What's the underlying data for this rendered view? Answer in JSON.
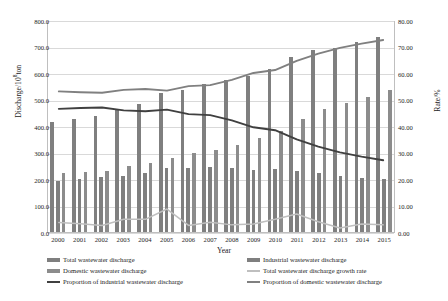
{
  "chart_data": {
    "type": "bar",
    "title": "",
    "xlabel": "Year",
    "ylabel_left": "Discharge/10⁸ton",
    "ylabel_right": "Rate/%",
    "categories": [
      "2000",
      "2001",
      "2002",
      "2003",
      "2004",
      "2005",
      "2006",
      "2007",
      "2008",
      "2009",
      "2010",
      "2011",
      "2012",
      "2013",
      "2014",
      "2015"
    ],
    "ylim_left": [
      0,
      800
    ],
    "ylim_right": [
      0,
      80
    ],
    "yticks_left": [
      "0.0",
      "100.0",
      "200.0",
      "300.0",
      "400.0",
      "500.0",
      "600.0",
      "700.0",
      "800.0"
    ],
    "yticks_right": [
      "0.00",
      "10.00",
      "20.00",
      "30.00",
      "40.00",
      "50.00",
      "60.00",
      "70.00",
      "80.00"
    ],
    "grid": true,
    "legend_position": "bottom",
    "series": [
      {
        "name": "Total wastewater discharge",
        "type": "bar",
        "axis": "left",
        "color": "#7f7f7f",
        "values": [
          415,
          428,
          439,
          460,
          482,
          524,
          537,
          557,
          572,
          589,
          617,
          659,
          685,
          695,
          716,
          735
        ]
      },
      {
        "name": "Industrial wastewater discharge",
        "type": "bar",
        "axis": "left",
        "color": "#7f7f7f",
        "values": [
          194,
          201,
          207,
          212,
          221,
          243,
          240,
          247,
          242,
          234,
          238,
          231,
          222,
          210,
          205,
          200
        ]
      },
      {
        "name": "Domestic wastewater discharge",
        "type": "bar",
        "axis": "left",
        "color": "#8c8c8c",
        "values": [
          221,
          227,
          232,
          248,
          261,
          281,
          297,
          310,
          330,
          355,
          380,
          428,
          463,
          485,
          511,
          535
        ]
      },
      {
        "name": "Total wastewater discharge growth rate",
        "type": "line",
        "axis": "right",
        "color": "#bfbfbf",
        "values": [
          3.6,
          3.1,
          2.5,
          4.8,
          4.8,
          8.7,
          2.5,
          3.7,
          2.7,
          3.0,
          4.8,
          6.8,
          3.9,
          1.5,
          3.0,
          2.7
        ]
      },
      {
        "name": "Proportion of industrial wastewater discharge",
        "type": "line",
        "axis": "right",
        "color": "#404040",
        "values": [
          46.7,
          47.0,
          47.2,
          46.1,
          45.8,
          46.4,
          44.7,
          44.3,
          42.3,
          39.7,
          38.6,
          35.1,
          32.4,
          30.2,
          28.6,
          27.2
        ]
      },
      {
        "name": "Proportion of domestic wastewater discharge",
        "type": "line",
        "axis": "right",
        "color": "#808080",
        "values": [
          53.3,
          53.0,
          52.8,
          53.9,
          54.2,
          53.6,
          55.3,
          55.7,
          57.7,
          60.3,
          61.4,
          64.9,
          67.6,
          69.8,
          71.4,
          72.8
        ]
      }
    ]
  },
  "legend": {
    "items": [
      {
        "label": "Total wastewater discharge",
        "marker": "bar",
        "color": "#7f7f7f"
      },
      {
        "label": "Industrial wastewater discharge",
        "marker": "bar",
        "color": "#7f7f7f"
      },
      {
        "label": "Domestic wastewater discharge",
        "marker": "bar",
        "color": "#8c8c8c"
      },
      {
        "label": "Total wastewater discharge growth rate",
        "marker": "line",
        "color": "#bfbfbf"
      },
      {
        "label": "Proportion of industrial wastewater discharge",
        "marker": "line",
        "color": "#404040"
      },
      {
        "label": "Proportion of domestic wastewater discharge",
        "marker": "line",
        "color": "#808080"
      }
    ]
  }
}
